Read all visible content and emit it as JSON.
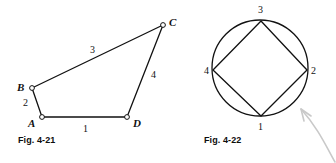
{
  "page": {
    "width": 336,
    "height": 163,
    "background": "#ffffff",
    "ink": "#111111",
    "arrow_color": "#c9c9c9"
  },
  "figure_left": {
    "caption": "Fig. 4-21",
    "caption_pos": {
      "x": 18,
      "y": 136
    },
    "shape": "quadrilateral",
    "vertices": [
      {
        "name": "A",
        "x": 42,
        "y": 117,
        "marker": "open-circle",
        "label_x": 28,
        "label_y": 118
      },
      {
        "name": "B",
        "x": 32,
        "y": 88,
        "marker": "open-circle",
        "label_x": 17,
        "label_y": 82
      },
      {
        "name": "C",
        "x": 163,
        "y": 25,
        "marker": "open-circle",
        "label_x": 169,
        "label_y": 17
      },
      {
        "name": "D",
        "x": 127,
        "y": 117,
        "marker": "open-circle",
        "label_x": 133,
        "label_y": 118
      }
    ],
    "edges": [
      {
        "label": "1",
        "from": "A",
        "to": "D",
        "label_x": 83,
        "label_y": 124
      },
      {
        "label": "2",
        "from": "A",
        "to": "B",
        "label_x": 23,
        "label_y": 98
      },
      {
        "label": "3",
        "from": "B",
        "to": "C",
        "label_x": 90,
        "label_y": 45
      },
      {
        "label": "4",
        "from": "C",
        "to": "D",
        "label_x": 151,
        "label_y": 70
      }
    ]
  },
  "figure_right": {
    "caption": "Fig. 4-22",
    "caption_pos": {
      "x": 204,
      "y": 136
    },
    "shape": "circle-with-inscribed-quadrilateral",
    "circle": {
      "cx": 260,
      "cy": 68,
      "r": 48
    },
    "points": [
      {
        "label": "1",
        "x": 261,
        "y": 116,
        "label_x": 258,
        "label_y": 122
      },
      {
        "label": "2",
        "x": 307,
        "y": 70,
        "label_x": 311,
        "label_y": 66
      },
      {
        "label": "3",
        "x": 261,
        "y": 21,
        "label_x": 258,
        "label_y": 5
      },
      {
        "label": "4",
        "x": 213,
        "y": 70,
        "label_x": 204,
        "label_y": 66
      }
    ],
    "arrow": {
      "name": "pointer-arrow",
      "from": {
        "x": 336,
        "y": 163
      },
      "to": {
        "x": 300,
        "y": 108
      },
      "direction": "up-left"
    }
  }
}
